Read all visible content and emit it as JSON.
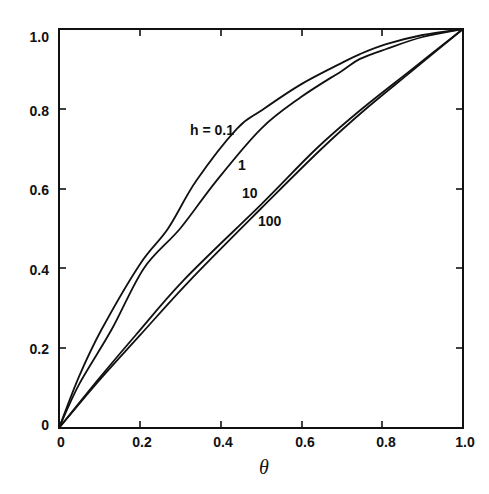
{
  "chart_data": {
    "type": "line",
    "title": "",
    "xlabel": "θ",
    "ylabel": "",
    "xlim": [
      0,
      1.0
    ],
    "ylim": [
      0,
      1.0
    ],
    "grid": false,
    "legend_position": "inline labels",
    "x_ticks": [
      "0",
      "0.2",
      "0.4",
      "0.6",
      "0.8",
      "1.0"
    ],
    "y_ticks": [
      "0",
      "0.2",
      "0.4",
      "0.6",
      "0.8",
      "1.0"
    ],
    "series": [
      {
        "name": "h = 0.1",
        "label": "h = 0.1",
        "x": [
          0,
          0.05,
          0.105,
          0.2,
          0.27,
          0.34,
          0.44,
          0.5,
          0.6,
          0.7,
          0.745,
          0.81,
          0.9,
          1.0
        ],
        "values": [
          0,
          0.13,
          0.246,
          0.41,
          0.5,
          0.62,
          0.75,
          0.795,
          0.862,
          0.915,
          0.937,
          0.962,
          0.985,
          1.0
        ]
      },
      {
        "name": "h = 1",
        "label": "1",
        "x": [
          0,
          0.05,
          0.13,
          0.21,
          0.3,
          0.39,
          0.5,
          0.6,
          0.7,
          0.745,
          0.81,
          0.9,
          1.0
        ],
        "values": [
          0,
          0.11,
          0.246,
          0.4,
          0.5,
          0.62,
          0.75,
          0.83,
          0.895,
          0.925,
          0.95,
          0.98,
          1.0
        ]
      },
      {
        "name": "h = 10",
        "label": "10",
        "x": [
          0,
          0.1,
          0.19,
          0.31,
          0.5,
          0.635,
          0.75,
          0.875,
          1.0
        ],
        "values": [
          0,
          0.125,
          0.233,
          0.372,
          0.56,
          0.698,
          0.8,
          0.9,
          1.0
        ]
      },
      {
        "name": "h = 100",
        "label": "100",
        "x": [
          0,
          0.1,
          0.2,
          0.326,
          0.5,
          0.648,
          0.76,
          0.88,
          1.0
        ],
        "values": [
          0,
          0.12,
          0.232,
          0.372,
          0.55,
          0.698,
          0.8,
          0.9,
          1.0
        ]
      }
    ],
    "annotations": [
      {
        "text": "h = 0.1",
        "x": 0.33,
        "y": 0.75
      },
      {
        "text": "1",
        "x": 0.45,
        "y": 0.66
      },
      {
        "text": "10",
        "x": 0.46,
        "y": 0.59
      },
      {
        "text": "100",
        "x": 0.52,
        "y": 0.52
      }
    ]
  },
  "axes": {
    "x_title": "θ",
    "x_tick_labels": [
      "0",
      "0.2",
      "0.4",
      "0.6",
      "0.8",
      "1.0"
    ],
    "y_tick_labels": [
      "0",
      "0.2",
      "0.4",
      "0.6",
      "0.8",
      "1.0"
    ]
  },
  "labels": {
    "h01": "h = 0.1",
    "h1": "1",
    "h10": "10",
    "h100": "100"
  },
  "style": {
    "line_color": "#111111",
    "background": "#ffffff"
  }
}
